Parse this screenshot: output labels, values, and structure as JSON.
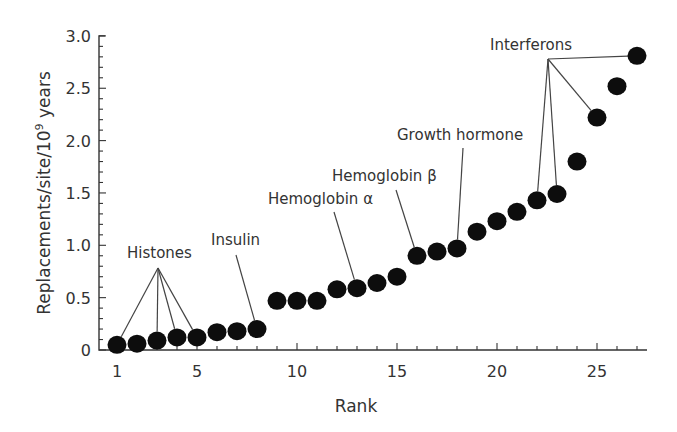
{
  "chart_data": {
    "type": "scatter",
    "title": "",
    "xlabel": "Rank",
    "ylabel": "Replacements/site/10^9 years",
    "ylabel_parts": {
      "prefix": "Replacements/site/10",
      "superscript": "9",
      "suffix": " years"
    },
    "xlim": [
      0.5,
      27.5
    ],
    "ylim": [
      0,
      3.0
    ],
    "x_ticks_major": [
      1,
      5,
      10,
      15,
      20,
      25
    ],
    "x_tick_labels": [
      "1",
      "5",
      "10",
      "15",
      "20",
      "25"
    ],
    "y_ticks_major": [
      0,
      0.5,
      1.0,
      1.5,
      2.0,
      2.5,
      3.0
    ],
    "y_tick_labels": [
      "0",
      "0.5",
      "1.0",
      "1.5",
      "2.0",
      "2.5",
      "3.0"
    ],
    "y_minor_step": 0.1,
    "grid": false,
    "legend": null,
    "x": [
      1,
      2,
      3,
      4,
      5,
      6,
      7,
      8,
      9,
      10,
      11,
      12,
      13,
      14,
      15,
      16,
      17,
      18,
      19,
      20,
      21,
      22,
      23,
      24,
      25,
      26,
      27
    ],
    "y": [
      0.05,
      0.06,
      0.09,
      0.12,
      0.12,
      0.17,
      0.18,
      0.2,
      0.47,
      0.47,
      0.47,
      0.58,
      0.59,
      0.64,
      0.7,
      0.9,
      0.94,
      0.97,
      1.13,
      1.23,
      1.32,
      1.43,
      1.49,
      1.8,
      2.22,
      2.52,
      2.81
    ],
    "annotations": [
      {
        "label": "Histones",
        "points": [
          1,
          3,
          4,
          5
        ],
        "text_x": 127,
        "text_y": 258,
        "hub": [
          158,
          268
        ]
      },
      {
        "label": "Insulin",
        "points": [
          8
        ],
        "text_x": 211,
        "text_y": 245,
        "hub": [
          236,
          255
        ]
      },
      {
        "label": "Hemoglobin α",
        "points": [
          13
        ],
        "text_x": 268,
        "text_y": 204,
        "hub": [
          334,
          212
        ]
      },
      {
        "label": "Hemoglobin β",
        "points": [
          16
        ],
        "text_x": 332,
        "text_y": 181,
        "hub": [
          396,
          190
        ]
      },
      {
        "label": "Growth hormone",
        "points": [
          18
        ],
        "text_x": 397,
        "text_y": 140,
        "hub": [
          463,
          148
        ]
      },
      {
        "label": "Interferons",
        "points": [
          22,
          23,
          25,
          27
        ],
        "text_x": 490,
        "text_y": 50,
        "hub": [
          548,
          59
        ]
      }
    ]
  },
  "axes": {
    "x_title": "Rank",
    "y_title": "Replacements/site/10^9 years"
  }
}
